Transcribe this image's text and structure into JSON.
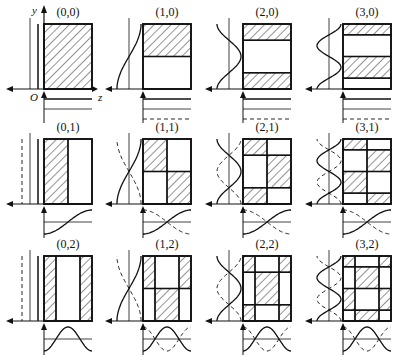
{
  "diagram": {
    "title": "",
    "axes": {
      "y_label": "y",
      "z_label": "z",
      "origin_label": "O"
    },
    "colors": {
      "ink": "#111111",
      "background": "#ffffff"
    },
    "modes": [
      {
        "label": "(0,0)",
        "m": 0,
        "n": 0
      },
      {
        "label": "(1,0)",
        "m": 1,
        "n": 0
      },
      {
        "label": "(2,0)",
        "m": 2,
        "n": 0
      },
      {
        "label": "(3,0)",
        "m": 3,
        "n": 0
      },
      {
        "label": "(0,1)",
        "m": 0,
        "n": 1
      },
      {
        "label": "(1,1)",
        "m": 1,
        "n": 1
      },
      {
        "label": "(2,1)",
        "m": 2,
        "n": 1
      },
      {
        "label": "(3,1)",
        "m": 3,
        "n": 1
      },
      {
        "label": "(0,2)",
        "m": 0,
        "n": 2
      },
      {
        "label": "(1,2)",
        "m": 1,
        "n": 2
      },
      {
        "label": "(2,2)",
        "m": 2,
        "n": 2
      },
      {
        "label": "(3,2)",
        "m": 3,
        "n": 2
      }
    ]
  }
}
